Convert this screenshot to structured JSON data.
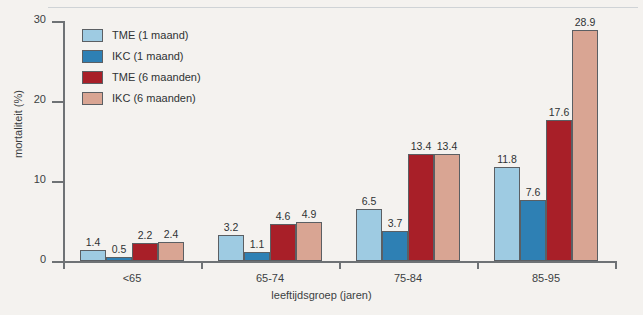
{
  "chart_data": {
    "type": "bar",
    "title": "",
    "xlabel": "leeftijdsgroep (jaren)",
    "ylabel": "mortaliteit (%)",
    "categories": [
      "<65",
      "65-74",
      "75-84",
      "85-95"
    ],
    "ylim": [
      0,
      30
    ],
    "yticks": [
      0,
      10,
      20,
      30
    ],
    "ytick_labels": [
      "0",
      "10",
      "20",
      "30"
    ],
    "grid": false,
    "legend_position": "top-left",
    "series": [
      {
        "name": "TME (1 maand)",
        "color": "#9ecbe2",
        "values": [
          1.4,
          3.2,
          6.5,
          11.8
        ],
        "value_labels": [
          "1.4",
          "3.2",
          "6.5",
          "11.8"
        ]
      },
      {
        "name": "IKC (1 maand)",
        "color": "#2e80b4",
        "values": [
          0.5,
          1.1,
          3.7,
          7.6
        ],
        "value_labels": [
          "0.5",
          "1.1",
          "3.7",
          "7.6"
        ]
      },
      {
        "name": "TME (6 maanden)",
        "color": "#a81f28",
        "values": [
          2.2,
          4.6,
          13.4,
          17.6
        ],
        "value_labels": [
          "2.2",
          "4.6",
          "13.4",
          "17.6"
        ]
      },
      {
        "name": "IKC (6 maanden)",
        "color": "#d9a593",
        "values": [
          2.4,
          4.9,
          13.4,
          28.9
        ],
        "value_labels": [
          "2.4",
          "4.9",
          "13.4",
          "28.9"
        ]
      }
    ]
  },
  "axis": {
    "y_title": "mortaliteit (%)",
    "x_title": "leeftijdsgroep (jaren)",
    "y_tick_labels": [
      "30",
      "20",
      "10",
      "0"
    ],
    "x_group_labels": [
      "<65",
      "65-74",
      "75-84",
      "85-95"
    ]
  },
  "legend": {
    "items": [
      {
        "label": "TME (1 maand)",
        "color": "#9ecbe2"
      },
      {
        "label": "IKC (1 maand)",
        "color": "#2e80b4"
      },
      {
        "label": "TME (6 maanden)",
        "color": "#a81f28"
      },
      {
        "label": "IKC (6 maanden)",
        "color": "#d9a593"
      }
    ]
  }
}
